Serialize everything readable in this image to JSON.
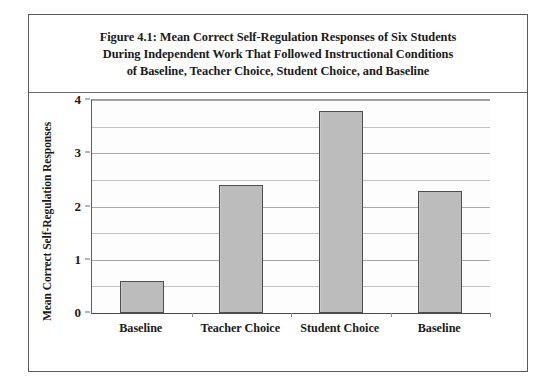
{
  "figure": {
    "caption_lines": [
      "Figure 4.1: Mean Correct Self-Regulation Responses of Six Students",
      "During Independent Work That Followed Instructional Conditions",
      "of Baseline, Teacher Choice, Student Choice, and Baseline"
    ]
  },
  "chart_data": {
    "type": "bar",
    "title": "Figure 4.1: Mean Correct Self-Regulation Responses of Six Students During Independent Work That Followed Instructional Conditions of Baseline, Teacher Choice, Student Choice, and Baseline",
    "categories": [
      "Baseline",
      "Teacher Choice",
      "Student Choice",
      "Baseline"
    ],
    "values": [
      0.6,
      2.4,
      3.8,
      2.3
    ],
    "xlabel": "",
    "ylabel": "Mean Correct Self-Regulation Responses",
    "ylim": [
      0,
      4
    ],
    "ytick_labels": [
      "0",
      "1",
      "2",
      "3",
      "4"
    ],
    "ytick_values": [
      0,
      1,
      2,
      3,
      4
    ],
    "minor_gridline_values": [
      0.5,
      1.5,
      2.5,
      3.5
    ],
    "grid": true,
    "legend": "none",
    "bar_fill_color": "#bcbcbc",
    "bar_border_color": "#4e4e4e",
    "gridline_color": "#a8a8a8",
    "plot_background_color": "#fdfdfd",
    "frame_border_color": "#5a5a5a"
  }
}
